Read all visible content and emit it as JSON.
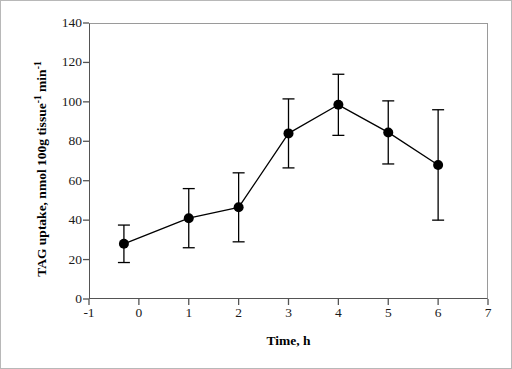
{
  "chart_data": {
    "type": "line",
    "title": "",
    "subtitle": "",
    "xlabel": "Time, h",
    "ylabel_parts": {
      "lead": "TAG uptake, nmol 100g tissue",
      "sup1": "-1",
      "mid": " min",
      "sup2": "-1"
    },
    "ylabel_plain": "TAG uptake, nmol 100g tissue-1 min-1",
    "xlim": [
      -1,
      7
    ],
    "ylim": [
      0,
      140
    ],
    "xticks": [
      -1,
      0,
      1,
      2,
      3,
      4,
      5,
      6,
      7
    ],
    "xtick_labels": [
      "-1",
      "0",
      "1",
      "2",
      "3",
      "4",
      "5",
      "6",
      "7"
    ],
    "yticks": [
      0,
      20,
      40,
      60,
      80,
      100,
      120,
      140
    ],
    "ytick_labels": [
      "0",
      "20",
      "40",
      "60",
      "80",
      "100",
      "120",
      "140"
    ],
    "grid": false,
    "legend": null,
    "marker": "filled-circle",
    "series": [
      {
        "name": "TAG uptake",
        "color": "#000000",
        "x": [
          -0.3,
          1,
          2,
          3,
          4,
          5,
          6
        ],
        "values": [
          28,
          41,
          46.5,
          84,
          98.5,
          84.5,
          68
        ],
        "errors": [
          9.5,
          15,
          17.5,
          17.5,
          15.5,
          16,
          28
        ]
      }
    ]
  },
  "figure": {
    "border_color": "#b8b8b8",
    "axis_color": "#545454",
    "frame_light_color": "#9a9a9a",
    "data_color": "#000000",
    "background": "#ffffff"
  }
}
